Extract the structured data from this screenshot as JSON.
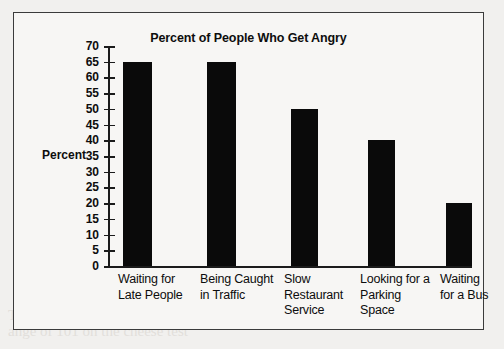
{
  "page": {
    "background_color": "#f1f0ee",
    "frame_border_color": "#3b3b3b",
    "bleed_through_text": [
      "Test tea who membership too ample",
      "ange of 101 on the cheese test"
    ]
  },
  "chart_data": {
    "type": "bar",
    "title": "Percent of People Who Get Angry",
    "xlabel": "",
    "ylabel": "Percent",
    "ylim": [
      0,
      70
    ],
    "ytick_step": 5,
    "yticks": [
      70,
      65,
      60,
      55,
      50,
      45,
      40,
      35,
      30,
      25,
      20,
      15,
      10,
      5,
      0
    ],
    "grid": false,
    "legend": false,
    "bar_color": "#0a0a0a",
    "categories": [
      "Waiting for Late People",
      "Being Caught in Traffic",
      "Slow Restaurant Service",
      "Looking for a Parking Space",
      "Waiting for a Bus"
    ],
    "category_label_lines": [
      [
        "Waiting for",
        "Late People"
      ],
      [
        "Being Caught",
        "in Traffic"
      ],
      [
        "Slow",
        "Restaurant",
        "Service"
      ],
      [
        "Looking for a",
        "Parking",
        "Space"
      ],
      [
        "Waiting",
        "for a Bus"
      ]
    ],
    "values": [
      65,
      65,
      50,
      40,
      20
    ]
  }
}
